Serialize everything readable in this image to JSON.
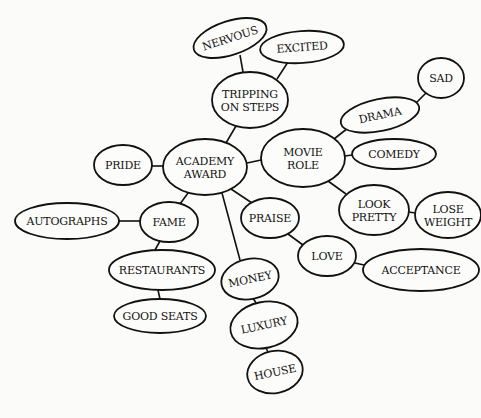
{
  "diagram": {
    "type": "concept-map",
    "background": "#fbfbf9",
    "stroke_color": "#111111",
    "nodes": [
      {
        "id": "academy_award",
        "lines": [
          "ACADEMY",
          "AWARD"
        ],
        "cx": 205,
        "cy": 167,
        "rx": 42,
        "ry": 28,
        "rot": 0
      },
      {
        "id": "tripping",
        "lines": [
          "TRIPPING",
          "ON STEPS"
        ],
        "cx": 250,
        "cy": 100,
        "rx": 38,
        "ry": 28,
        "rot": 0
      },
      {
        "id": "nervous",
        "lines": [
          "NERVOUS"
        ],
        "cx": 230,
        "cy": 38,
        "rx": 38,
        "ry": 17,
        "rot": -18
      },
      {
        "id": "excited",
        "lines": [
          "EXCITED"
        ],
        "cx": 302,
        "cy": 47,
        "rx": 42,
        "ry": 16,
        "rot": -4
      },
      {
        "id": "movie_role",
        "lines": [
          "MOVIE",
          "ROLE"
        ],
        "cx": 303,
        "cy": 158,
        "rx": 42,
        "ry": 29,
        "rot": 0
      },
      {
        "id": "drama",
        "lines": [
          "DRAMA"
        ],
        "cx": 380,
        "cy": 115,
        "rx": 40,
        "ry": 16,
        "rot": -12
      },
      {
        "id": "sad",
        "lines": [
          "SAD"
        ],
        "cx": 441,
        "cy": 78,
        "rx": 23,
        "ry": 20,
        "rot": 0
      },
      {
        "id": "comedy",
        "lines": [
          "COMEDY"
        ],
        "cx": 394,
        "cy": 154,
        "rx": 42,
        "ry": 15,
        "rot": 0
      },
      {
        "id": "pride",
        "lines": [
          "PRIDE"
        ],
        "cx": 123,
        "cy": 165,
        "rx": 29,
        "ry": 20,
        "rot": 0
      },
      {
        "id": "look_pretty",
        "lines": [
          "LOOK",
          "PRETTY"
        ],
        "cx": 374,
        "cy": 210,
        "rx": 35,
        "ry": 25,
        "rot": 0
      },
      {
        "id": "lose_weight",
        "lines": [
          "LOSE",
          "WEIGHT"
        ],
        "cx": 448,
        "cy": 215,
        "rx": 33,
        "ry": 23,
        "rot": 0
      },
      {
        "id": "fame",
        "lines": [
          "FAME"
        ],
        "cx": 169,
        "cy": 222,
        "rx": 29,
        "ry": 20,
        "rot": 0
      },
      {
        "id": "autographs",
        "lines": [
          "AUTOGRAPHS"
        ],
        "cx": 67,
        "cy": 221,
        "rx": 52,
        "ry": 18,
        "rot": 0
      },
      {
        "id": "restaurants",
        "lines": [
          "RESTAURANTS"
        ],
        "cx": 162,
        "cy": 270,
        "rx": 53,
        "ry": 20,
        "rot": 0
      },
      {
        "id": "good_seats",
        "lines": [
          "GOOD SEATS"
        ],
        "cx": 160,
        "cy": 316,
        "rx": 46,
        "ry": 17,
        "rot": 0
      },
      {
        "id": "praise",
        "lines": [
          "PRAISE"
        ],
        "cx": 270,
        "cy": 218,
        "rx": 29,
        "ry": 20,
        "rot": 0
      },
      {
        "id": "love",
        "lines": [
          "LOVE"
        ],
        "cx": 327,
        "cy": 256,
        "rx": 29,
        "ry": 20,
        "rot": 0
      },
      {
        "id": "acceptance",
        "lines": [
          "ACCEPTANCE"
        ],
        "cx": 421,
        "cy": 270,
        "rx": 58,
        "ry": 21,
        "rot": 0
      },
      {
        "id": "money",
        "lines": [
          "MONEY"
        ],
        "cx": 250,
        "cy": 279,
        "rx": 29,
        "ry": 20,
        "rot": -12
      },
      {
        "id": "luxury",
        "lines": [
          "LUXURY"
        ],
        "cx": 264,
        "cy": 325,
        "rx": 34,
        "ry": 23,
        "rot": -12
      },
      {
        "id": "house",
        "lines": [
          "HOUSE"
        ],
        "cx": 275,
        "cy": 372,
        "rx": 28,
        "ry": 21,
        "rot": -12
      }
    ],
    "edges": [
      {
        "from": "nervous",
        "to": "tripping",
        "x1": 240,
        "y1": 55,
        "x2": 243,
        "y2": 72
      },
      {
        "from": "excited",
        "to": "tripping",
        "x1": 288,
        "y1": 62,
        "x2": 277,
        "y2": 79
      },
      {
        "from": "tripping",
        "to": "academy_award",
        "x1": 236,
        "y1": 126,
        "x2": 226,
        "y2": 143
      },
      {
        "from": "academy_award",
        "to": "movie_role",
        "x1": 247,
        "y1": 163,
        "x2": 261,
        "y2": 160
      },
      {
        "from": "pride",
        "to": "academy_award",
        "x1": 152,
        "y1": 166,
        "x2": 163,
        "y2": 166
      },
      {
        "from": "movie_role",
        "to": "drama",
        "x1": 334,
        "y1": 139,
        "x2": 348,
        "y2": 128
      },
      {
        "from": "drama",
        "to": "sad",
        "x1": 415,
        "y1": 104,
        "x2": 426,
        "y2": 93
      },
      {
        "from": "movie_role",
        "to": "comedy",
        "x1": 345,
        "y1": 156,
        "x2": 352,
        "y2": 155
      },
      {
        "from": "movie_role",
        "to": "look_pretty",
        "x1": 328,
        "y1": 181,
        "x2": 346,
        "y2": 194
      },
      {
        "from": "look_pretty",
        "to": "lose_weight",
        "x1": 409,
        "y1": 212,
        "x2": 415,
        "y2": 213
      },
      {
        "from": "academy_award",
        "to": "fame",
        "x1": 188,
        "y1": 193,
        "x2": 180,
        "y2": 204
      },
      {
        "from": "autographs",
        "to": "fame",
        "x1": 119,
        "y1": 221,
        "x2": 140,
        "y2": 221
      },
      {
        "from": "fame",
        "to": "restaurants",
        "x1": 160,
        "y1": 241,
        "x2": 155,
        "y2": 250
      },
      {
        "from": "restaurants",
        "to": "good_seats",
        "x1": 158,
        "y1": 290,
        "x2": 160,
        "y2": 299
      },
      {
        "from": "academy_award",
        "to": "praise",
        "x1": 231,
        "y1": 189,
        "x2": 252,
        "y2": 203
      },
      {
        "from": "academy_award",
        "to": "money",
        "x1": 222,
        "y1": 193,
        "x2": 240,
        "y2": 260
      },
      {
        "from": "praise",
        "to": "love",
        "x1": 288,
        "y1": 234,
        "x2": 303,
        "y2": 245
      },
      {
        "from": "love",
        "to": "acceptance",
        "x1": 355,
        "y1": 263,
        "x2": 364,
        "y2": 265
      },
      {
        "from": "money",
        "to": "luxury",
        "x1": 253,
        "y1": 298,
        "x2": 256,
        "y2": 303
      },
      {
        "from": "luxury",
        "to": "house",
        "x1": 266,
        "y1": 348,
        "x2": 268,
        "y2": 352
      }
    ]
  }
}
